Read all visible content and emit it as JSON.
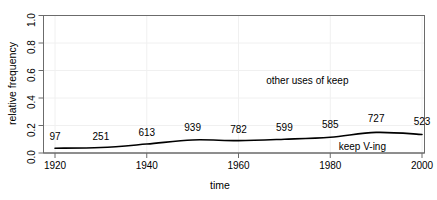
{
  "chart_data": {
    "type": "line",
    "title": "",
    "subtitle": "",
    "xlabel": "time",
    "ylabel": "relative frequency",
    "xlim": [
      1920,
      2000
    ],
    "ylim": [
      0.0,
      1.0
    ],
    "xticks": [
      "1920",
      "1940",
      "1960",
      "1980",
      "2000"
    ],
    "xtick_values": [
      1920,
      1940,
      1960,
      1980,
      2000
    ],
    "yticks": [
      "0.0",
      "0.2",
      "0.4",
      "0.6",
      "0.8",
      "1.0"
    ],
    "ytick_values": [
      0.0,
      0.2,
      0.4,
      0.6,
      0.8,
      1.0
    ],
    "grid": true,
    "legend_position": "none",
    "x": [
      1920,
      1930,
      1940,
      1950,
      1960,
      1970,
      1980,
      1990,
      2000
    ],
    "series": [
      {
        "name": "keep V-ing",
        "color": "#000000",
        "values": [
          0.035,
          0.04,
          0.065,
          0.095,
          0.09,
          0.1,
          0.115,
          0.15,
          0.135
        ]
      }
    ],
    "point_labels": [
      "97",
      "251",
      "613",
      "939",
      "782",
      "599",
      "585",
      "727",
      "523"
    ],
    "annotations": [
      {
        "text": "other uses of keep",
        "x": 1975,
        "y": 0.52
      },
      {
        "text": "keep V-ing",
        "x": 1987,
        "y": 0.035
      }
    ]
  },
  "axes": {
    "x_title": "time",
    "y_title": "relative frequency"
  },
  "colors": {
    "line": "#000000",
    "grid": "#f0f0f0",
    "box": "#6b6b6b",
    "text": "#000000",
    "background": "#ffffff"
  }
}
